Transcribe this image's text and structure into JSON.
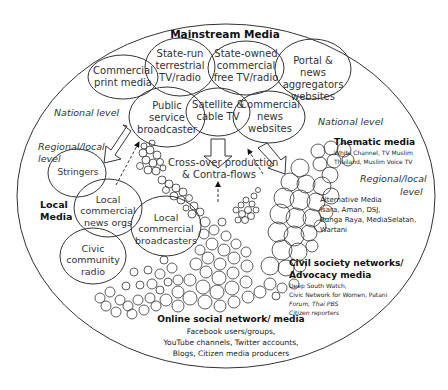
{
  "diagram": {
    "title": "Mainstream Media",
    "mainstream_nodes": [
      {
        "id": "commercial-print-media",
        "label": "Commercial print media"
      },
      {
        "id": "state-run-terrestrial",
        "label": "State-run terrestrial TV/radio"
      },
      {
        "id": "state-owned-commercial",
        "label": "State-owned commercial free TV/radio"
      },
      {
        "id": "portal-news-aggregators",
        "label": "Portal & news aggregators websites"
      },
      {
        "id": "public-service-broadcaster",
        "label": "Public service broadcaster"
      },
      {
        "id": "satellite-cable",
        "label": "Satellite & cable TV"
      },
      {
        "id": "commercial-news-websites",
        "label": "Commercial news websites"
      }
    ],
    "level_labels": {
      "national_left": "National level",
      "national_right": "National level",
      "regional_left_1": "Regional/local",
      "regional_left_2": "level",
      "regional_right_1": "Regional/local",
      "regional_right_2": "level"
    },
    "local_media": {
      "title_1": "Local",
      "title_2": "Media",
      "nodes": [
        {
          "id": "stringers",
          "label": "Stringers"
        },
        {
          "id": "local-commercial-news-orgs",
          "label": "Local commercial news orgs"
        },
        {
          "id": "local-commercial-broadcasters",
          "label": "Local commercial broadcasters"
        },
        {
          "id": "civic-community-radio",
          "label": "Civic community radio"
        }
      ]
    },
    "crossover": {
      "line1": "Cross-over production",
      "line2": "& Contra-flows"
    },
    "thematic": {
      "title": "Thematic media",
      "line1": "White Channel,  TV Muslim",
      "line2": "Thailand,  Muslim Voice TV"
    },
    "alternative": {
      "title": "Alternative Media",
      "line1": "Isara, Aman, DSJ,",
      "line2": "Bunga Raya, MediaSelatan,",
      "line3": "Wartani"
    },
    "civil_society": {
      "title1": "Civil society networks/",
      "title2": "Advocacy media",
      "line1": "Deep South Watch,",
      "line2": "Civic Network for Women, Patani",
      "line3": "Forum, Thai PBS",
      "line4": "Citizen reporters"
    },
    "online": {
      "title": "Online social network/ media",
      "line1": "Facebook users/groups,",
      "line2": "YouTube channels, Twitter accounts,",
      "line3": "Blogs, Citizen media producers"
    },
    "colors": {
      "stroke": "#333333",
      "text": "#222222",
      "background": "#ffffff"
    }
  }
}
